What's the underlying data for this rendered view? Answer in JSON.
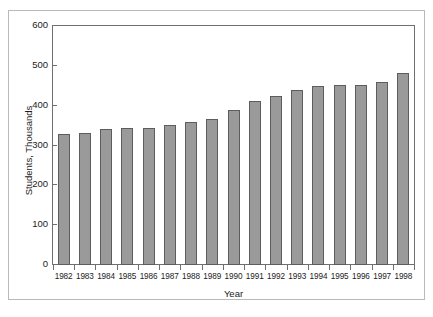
{
  "chart_data": {
    "type": "bar",
    "title": "",
    "xlabel": "Year",
    "ylabel": "Students, Thousands",
    "categories": [
      "1982",
      "1983",
      "1984",
      "1985",
      "1986",
      "1987",
      "1988",
      "1989",
      "1990",
      "1991",
      "1992",
      "1993",
      "1994",
      "1995",
      "1996",
      "1997",
      "1998"
    ],
    "values": [
      328,
      331,
      342,
      344,
      345,
      352,
      358,
      367,
      389,
      411,
      424,
      440,
      450,
      453,
      453,
      459,
      483
    ],
    "ylim": [
      0,
      600
    ],
    "yticks": [
      0,
      100,
      200,
      300,
      400,
      500,
      600
    ],
    "ytick_labels": [
      "0",
      "100",
      "200",
      "300",
      "400",
      "500",
      "600"
    ],
    "grid": false,
    "legend": false,
    "bar_color": "#9a9a9a",
    "bar_edge_color": "#5d5d5d",
    "axis_color": "#6f6f6f",
    "frame_color": "#b9b9b9",
    "background": "#ffffff"
  }
}
